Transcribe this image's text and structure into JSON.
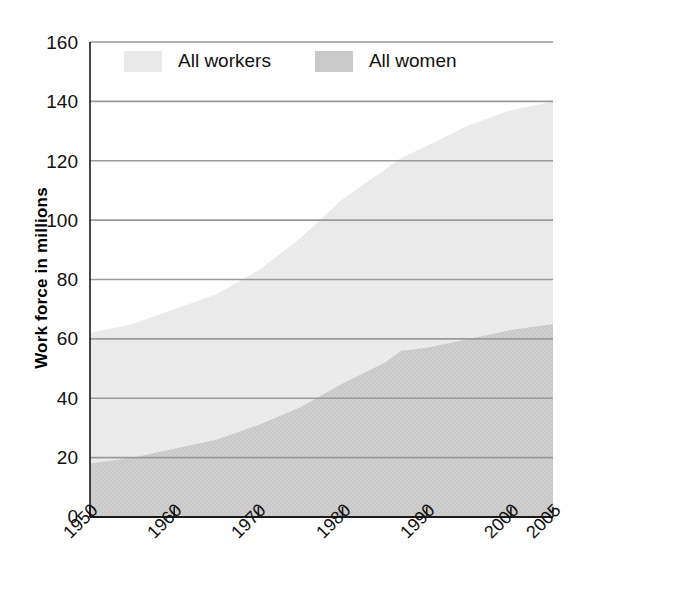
{
  "chart_data": {
    "type": "area",
    "title": "",
    "xlabel": "",
    "ylabel": "Work force in millions",
    "xlim": [
      1950,
      2005
    ],
    "ylim": [
      0,
      160
    ],
    "ytick_step": 20,
    "grid": true,
    "legend_position": "top-inside",
    "xticks": [
      1950,
      1960,
      1970,
      1980,
      1990,
      2000,
      2005
    ],
    "xtick_labels": [
      "1950",
      "1960",
      "1970",
      "1980",
      "1990",
      "2000",
      "2005"
    ],
    "yticks": [
      0,
      20,
      40,
      60,
      80,
      100,
      120,
      140,
      160
    ],
    "ytick_labels": [
      "0",
      "20",
      "40",
      "60",
      "80",
      "100",
      "120",
      "140",
      "160"
    ],
    "x": [
      1950,
      1955,
      1960,
      1965,
      1970,
      1975,
      1980,
      1985,
      1987,
      1990,
      1995,
      2000,
      2005
    ],
    "series": [
      {
        "name": "All workers",
        "color": "#e9e9e9",
        "values": [
          62,
          65,
          70,
          75,
          83,
          94,
          107,
          117,
          121,
          125,
          132,
          137,
          140
        ]
      },
      {
        "name": "All women",
        "color": "#c9c9c9",
        "values": [
          18,
          20,
          23,
          26,
          31,
          37,
          45,
          52,
          56,
          57,
          60,
          63,
          65
        ]
      }
    ],
    "colors": {
      "workers_fill": "#e9e9e9",
      "women_fill": "#c9c9c9",
      "gridline": "#9a9a9a",
      "axis": "#1a1a1a",
      "text": "#111111",
      "background": "#ffffff"
    }
  },
  "legend": {
    "items": [
      {
        "label": "All workers"
      },
      {
        "label": "All women"
      }
    ]
  },
  "axis": {
    "y_title": "Work force in millions"
  }
}
